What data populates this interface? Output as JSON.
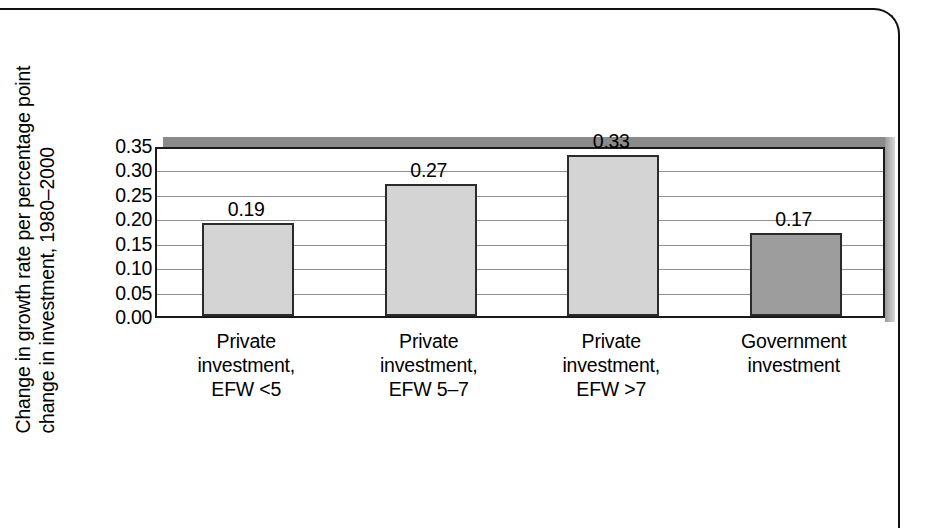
{
  "chart_data": {
    "type": "bar",
    "title": "",
    "subtitle": "",
    "xlabel": "",
    "ylabel_lines": [
      "Change in growth rate per percentage point",
      "change in investment, 1980–2000"
    ],
    "ylabel": "Change in growth rate per percentage point change in investment, 1980–2000",
    "categories": [
      "Private investment, EFW <5",
      "Private investment, EFW 5–7",
      "Private investment, EFW >7",
      "Government investment"
    ],
    "category_lines": [
      [
        "Private",
        "investment,",
        "EFW <5"
      ],
      [
        "Private",
        "investment,",
        "EFW 5–7"
      ],
      [
        "Private",
        "investment,",
        "EFW >7"
      ],
      [
        "Government",
        "investment"
      ]
    ],
    "values": [
      0.19,
      0.27,
      0.33,
      0.17
    ],
    "value_labels": [
      "0.19",
      "0.27",
      "0.33",
      "0.17"
    ],
    "bar_colors": [
      "#d4d4d4",
      "#d4d4d4",
      "#d4d4d4",
      "#9d9d9d"
    ],
    "ylim": [
      0.0,
      0.35
    ],
    "ytick_values": [
      0.35,
      0.3,
      0.25,
      0.2,
      0.15,
      0.1,
      0.05,
      0.0
    ],
    "ytick_labels": [
      "0.35",
      "0.30",
      "0.25",
      "0.20",
      "0.15",
      "0.10",
      "0.05",
      "0.00"
    ],
    "grid": true,
    "grid_axis": "y",
    "legend": false,
    "legend_position": "none",
    "bar_outline_color": "#2b2b2b",
    "plot_shadow_color": "#8a8a8a",
    "gridline_color": "#8f8f8f",
    "axis_color": "#1a1a1a",
    "background_color": "#ffffff"
  }
}
